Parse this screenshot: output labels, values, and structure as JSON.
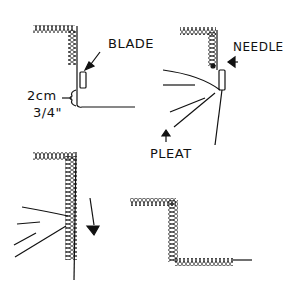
{
  "diagram": {
    "type": "sewing instruction sketch",
    "panels": [
      {
        "id": "panel-1",
        "labels": {
          "blade": "BLADE",
          "measure_cm": "2cm",
          "measure_in": "3/4\""
        }
      },
      {
        "id": "panel-2",
        "labels": {
          "needle": "NEEDLE",
          "pleat": "PLEAT"
        }
      },
      {
        "id": "panel-3",
        "labels": {}
      },
      {
        "id": "panel-4",
        "labels": {}
      }
    ]
  },
  "colors": {
    "ink": "#111111",
    "background": "#ffffff"
  }
}
